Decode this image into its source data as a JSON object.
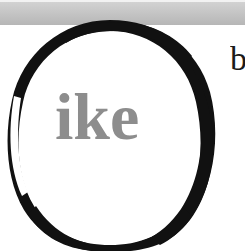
{
  "canvas": {
    "width": 245,
    "height": 251,
    "background_color": "#ffffff",
    "description": "Cropped scan of a printed page with a hand-drawn ink circle annotation"
  },
  "scan_band": {
    "name": "top-gray-band",
    "color_top": "#d2d2d2",
    "color_bottom": "#b6b6b6",
    "top": 2,
    "height": 23
  },
  "document_text": {
    "word_fragment": "ike",
    "word_fragment_color": "#8d8d8d",
    "edge_letter_fragment": "b",
    "edge_letter_color": "#1b1b1b"
  },
  "annotation": {
    "shape": "circle",
    "style": "hand-drawn-ink-ring",
    "color": "#111111",
    "center_x": 110,
    "center_y": 134,
    "radius_x": 101,
    "radius_y": 111,
    "stroke_min": 3,
    "stroke_max": 19
  }
}
